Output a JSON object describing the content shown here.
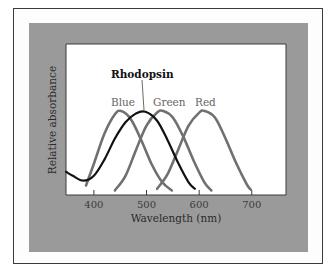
{
  "chart_data": {
    "type": "line",
    "title": "",
    "xlabel": "Wavelength (nm)",
    "ylabel": "Relative absorbance",
    "xlim": [
      347,
      765
    ],
    "ylim": [
      0,
      1
    ],
    "xticks": [
      400,
      500,
      600,
      700
    ],
    "grid": false,
    "legend": "inline labels above peaks",
    "series": [
      {
        "name": "Blue",
        "color": "#707070",
        "peak_nm": 452,
        "peak_value": 1.0,
        "x": [
          385,
          400,
          420,
          440,
          452,
          470,
          490,
          510,
          530,
          548
        ],
        "y": [
          0.08,
          0.35,
          0.72,
          0.96,
          1.0,
          0.9,
          0.64,
          0.34,
          0.12,
          0.02
        ]
      },
      {
        "name": "Rhodopsin",
        "color": "#111111",
        "peak_nm": 498,
        "peak_value": 0.99,
        "x": [
          347,
          360,
          380,
          400,
          420,
          440,
          460,
          480,
          498,
          520,
          540,
          560,
          580,
          592
        ],
        "y": [
          0.25,
          0.2,
          0.14,
          0.2,
          0.4,
          0.66,
          0.86,
          0.97,
          0.99,
          0.88,
          0.64,
          0.36,
          0.12,
          0.04
        ]
      },
      {
        "name": "Green",
        "color": "#707070",
        "peak_nm": 532,
        "peak_value": 1.0,
        "x": [
          440,
          460,
          480,
          500,
          520,
          532,
          550,
          570,
          590,
          610,
          623
        ],
        "y": [
          0.02,
          0.2,
          0.52,
          0.82,
          0.98,
          1.0,
          0.92,
          0.68,
          0.38,
          0.12,
          0.02
        ]
      },
      {
        "name": "Red",
        "color": "#707070",
        "peak_nm": 610,
        "peak_value": 1.0,
        "x": [
          520,
          540,
          560,
          580,
          600,
          610,
          630,
          650,
          670,
          690,
          698
        ],
        "y": [
          0.04,
          0.22,
          0.52,
          0.82,
          0.98,
          1.0,
          0.92,
          0.66,
          0.36,
          0.1,
          0.03
        ]
      }
    ],
    "annotations": [
      {
        "text": "Rhodopsin",
        "points_to_nm": 498
      }
    ]
  },
  "labels": {
    "xlabel": "Wavelength (nm)",
    "ylabel": "Relative absorbance",
    "ticks": [
      "400",
      "500",
      "600",
      "700"
    ],
    "blue": "Blue",
    "green": "Green",
    "red": "Red",
    "rhodopsin": "Rhodopsin"
  }
}
